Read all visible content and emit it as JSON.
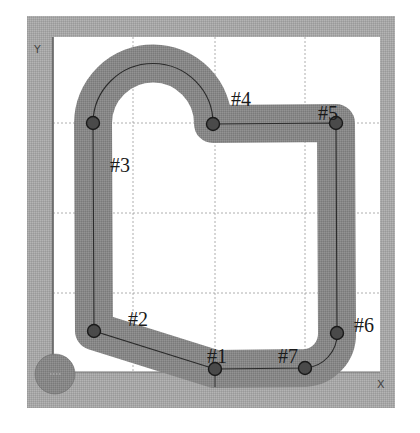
{
  "diagram": {
    "type": "toolpath",
    "axes": {
      "x_label": "X",
      "y_label": "Y"
    },
    "colors": {
      "frame": "#a9a9a9",
      "frame_border": "#6e6e6e",
      "background": "#ffffff",
      "grid": "#9a9a9a",
      "path_band": "#8a8a8a",
      "path_line": "#2b2b2b",
      "node_fill": "#4a4a4a",
      "node_stroke": "#1a1a1a",
      "origin_tool": "#5e5e5e",
      "label": "#1a1a1a"
    },
    "grid": {
      "x": [
        133,
        215,
        305
      ],
      "y": [
        123,
        213,
        293
      ]
    },
    "points": [
      {
        "id": "#1",
        "label": "#1",
        "x": 215,
        "y": 369,
        "lx": 207,
        "ly": 349
      },
      {
        "id": "#2",
        "label": "#2",
        "x": 94,
        "y": 331,
        "lx": 128,
        "ly": 312
      },
      {
        "id": "#3",
        "label": "#3",
        "x": 93,
        "y": 123,
        "lx": 110,
        "ly": 158
      },
      {
        "id": "#4",
        "label": "#4",
        "x": 213,
        "y": 124,
        "lx": 231,
        "ly": 92
      },
      {
        "id": "#5",
        "label": "#5",
        "x": 336,
        "y": 123,
        "lx": 318,
        "ly": 106
      },
      {
        "id": "#6",
        "label": "#6",
        "x": 337,
        "y": 333,
        "lx": 354,
        "ly": 318
      },
      {
        "id": "#7",
        "label": "#7",
        "x": 305,
        "y": 368,
        "lx": 278,
        "ly": 349
      }
    ],
    "segments": [
      {
        "from": "#1",
        "to": "#2",
        "kind": "line"
      },
      {
        "from": "#2",
        "to": "#3",
        "kind": "line"
      },
      {
        "from": "#3",
        "to": "#4",
        "kind": "arc",
        "radius": 60
      },
      {
        "from": "#4",
        "to": "#5",
        "kind": "line"
      },
      {
        "from": "#5",
        "to": "#6",
        "kind": "line"
      },
      {
        "from": "#6",
        "to": "#7",
        "kind": "arc",
        "radius": 34
      },
      {
        "from": "#7",
        "to": "#1",
        "kind": "line"
      }
    ]
  }
}
